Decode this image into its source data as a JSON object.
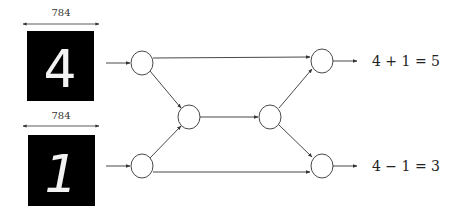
{
  "diagram": {
    "inputs": [
      {
        "id": "input-top",
        "dimension_label": "784",
        "digit": "4"
      },
      {
        "id": "input-bottom",
        "dimension_label": "784",
        "digit": "1"
      }
    ],
    "nodes": [
      {
        "id": "A",
        "role": "input-node-top"
      },
      {
        "id": "B",
        "role": "input-node-bottom"
      },
      {
        "id": "C",
        "role": "hidden-node-left"
      },
      {
        "id": "D",
        "role": "hidden-node-right"
      },
      {
        "id": "E",
        "role": "output-node-top"
      },
      {
        "id": "F",
        "role": "output-node-bottom"
      }
    ],
    "edges": [
      [
        "image-top",
        "A"
      ],
      [
        "image-bottom",
        "B"
      ],
      [
        "A",
        "E"
      ],
      [
        "A",
        "C"
      ],
      [
        "B",
        "C"
      ],
      [
        "B",
        "F"
      ],
      [
        "C",
        "D"
      ],
      [
        "D",
        "E"
      ],
      [
        "D",
        "F"
      ],
      [
        "E",
        "output-top"
      ],
      [
        "F",
        "output-bottom"
      ]
    ],
    "outputs": [
      {
        "id": "output-top",
        "equation": "4 + 1 = 5"
      },
      {
        "id": "output-bottom",
        "equation": "4 − 1 = 3"
      }
    ],
    "colors": {
      "line": "#333333",
      "image_bg": "#000000",
      "digit": "#f2f2f2"
    }
  }
}
